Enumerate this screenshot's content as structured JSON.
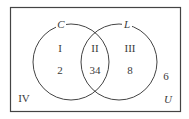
{
  "diagram": {
    "type": "venn",
    "universe_label": "U",
    "sets": [
      {
        "label": "C"
      },
      {
        "label": "L"
      }
    ],
    "regions": [
      {
        "roman": "I",
        "value": "2",
        "description": "C only"
      },
      {
        "roman": "II",
        "value": "34",
        "description": "C and L"
      },
      {
        "roman": "III",
        "value": "8",
        "description": "L only"
      },
      {
        "roman": "IV",
        "value": "6",
        "description": "neither C nor L"
      }
    ],
    "colors": {
      "stroke": "#444444",
      "text": "#3a3a3a",
      "background": "#ffffff"
    }
  }
}
